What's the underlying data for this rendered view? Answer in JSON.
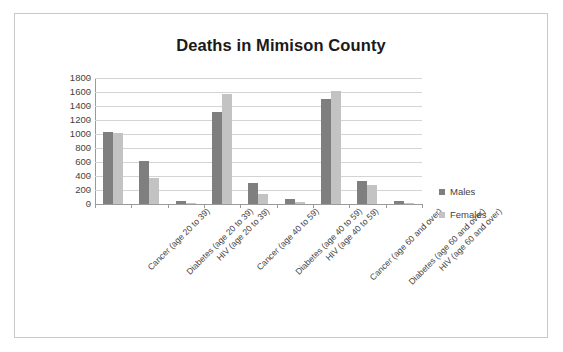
{
  "chart_data": {
    "type": "bar",
    "title": "Deaths in Mimison County",
    "xlabel": "",
    "ylabel": "",
    "ylim": [
      0,
      1800
    ],
    "ytick_step": 200,
    "yticks": [
      1800,
      1600,
      1400,
      1200,
      1000,
      800,
      600,
      400,
      200,
      0
    ],
    "grid": true,
    "legend_position": "right",
    "categories": [
      "Cancer (age 20 to 39)",
      "Diabetes (age 20 to 39)",
      "HIV (age 20 to 39)",
      "Cancer (age 40 to 59)",
      "Diabetes (age 40 to 59)",
      "HIV (age 40 to 59)",
      "Cancer (age 60 and over)",
      "Diabetes (age 60 and over)",
      "HIV (age 60 and over)"
    ],
    "series": [
      {
        "name": "Males",
        "color": "#7f7f7f",
        "values": [
          1030,
          620,
          40,
          1320,
          300,
          70,
          1500,
          330,
          40
        ]
      },
      {
        "name": "Females",
        "color": "#c3c3c3",
        "values": [
          1020,
          370,
          20,
          1570,
          150,
          30,
          1620,
          270,
          20
        ]
      }
    ]
  },
  "legend": {
    "items": [
      {
        "label": "Males",
        "color": "#7f7f7f"
      },
      {
        "label": "Females",
        "color": "#c3c3c3"
      }
    ]
  }
}
